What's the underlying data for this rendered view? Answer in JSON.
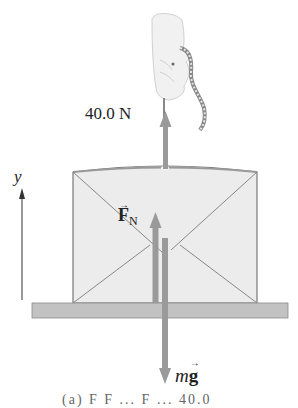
{
  "figure": {
    "type": "free-body diagram",
    "forces": {
      "tension": {
        "label": "40.0 N",
        "direction": "up"
      },
      "normal": {
        "label_symbol": "F",
        "label_subscript": "N",
        "vector_mark": "→",
        "direction": "up"
      },
      "weight": {
        "label_m": "m",
        "label_g": "g",
        "vector_mark": "→",
        "direction": "down"
      }
    },
    "axis": {
      "label": "y",
      "direction": "up"
    },
    "caption_partial": "(a) F F ... F ... 40.0"
  },
  "colors": {
    "arrow": "#9a9a9a",
    "box_fill": "#ececec",
    "box_stroke": "#777777",
    "ground": "#bdbdbd",
    "text": "#222222"
  }
}
